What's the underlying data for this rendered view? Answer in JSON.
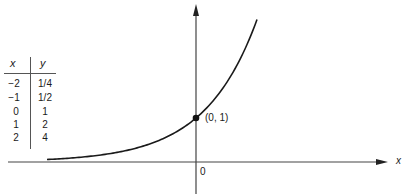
{
  "chart_data": {
    "type": "line",
    "title": "",
    "function": "y = 2^x",
    "xlabel": "x",
    "ylabel": "",
    "x": [
      -2,
      -1,
      0,
      1,
      2
    ],
    "y": [
      0.25,
      0.5,
      1,
      2,
      4
    ],
    "table": {
      "headers": [
        "x",
        "y"
      ],
      "rows": [
        [
          "−2",
          "1/4"
        ],
        [
          "−1",
          "1/2"
        ],
        [
          "0",
          "1"
        ],
        [
          "1",
          "2"
        ],
        [
          "2",
          "4"
        ]
      ]
    },
    "annotations": [
      {
        "label": "(0, 1)",
        "x": 0,
        "y": 1,
        "marker": "dot"
      }
    ],
    "origin_label": "0",
    "grid": false,
    "xlim": [
      -4.2,
      5.6
    ],
    "ylim": [
      -0.7,
      3.7
    ]
  },
  "labels": {
    "x_axis": "x",
    "origin": "0",
    "point": "(0, 1)",
    "table_x": "x",
    "table_y": "y"
  }
}
